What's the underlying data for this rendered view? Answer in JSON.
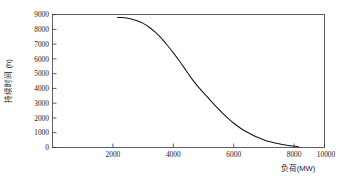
{
  "chart_data": {
    "type": "line",
    "title": "",
    "subtitle": "",
    "xlabel": "负荷(MW)",
    "ylabel": "持续时间 (h)",
    "xlim": [
      1000,
      10000
    ],
    "ylim": [
      0,
      9000
    ],
    "xticks": [
      2000,
      4000,
      6000,
      8000,
      10000
    ],
    "xtick_labels": [
      "2000",
      "4000",
      "6000",
      "8000",
      "10000"
    ],
    "yticks": [
      0,
      1000,
      2000,
      3000,
      4000,
      5000,
      6000,
      7000,
      8000,
      9000
    ],
    "ytick_labels": [
      "0",
      "1000",
      "2000",
      "3000",
      "4000",
      "5000",
      "6000",
      "7000",
      "8000",
      "9000"
    ],
    "grid": false,
    "legend": null,
    "legend_position": "none",
    "series": [
      {
        "name": "负荷持续曲线",
        "color": "#141414",
        "x": [
          3150,
          3300,
          3450,
          3600,
          3800,
          4000,
          4200,
          4400,
          4600,
          4800,
          5000,
          5200,
          5400,
          5600,
          5800,
          6000,
          6200,
          6400,
          6600,
          6800,
          7000,
          7200,
          7400,
          7600,
          7800,
          8000,
          8200,
          8400,
          8600,
          8800,
          9000,
          9150
        ],
        "y": [
          8800,
          8790,
          8760,
          8700,
          8580,
          8400,
          8140,
          7800,
          7400,
          6920,
          6400,
          5850,
          5270,
          4680,
          4150,
          3700,
          3240,
          2800,
          2380,
          1990,
          1640,
          1340,
          1080,
          860,
          670,
          510,
          385,
          285,
          205,
          140,
          80,
          30
        ]
      }
    ]
  },
  "axes": {
    "x_axis_name": "load-axis",
    "y_axis_name": "duration-axis"
  }
}
